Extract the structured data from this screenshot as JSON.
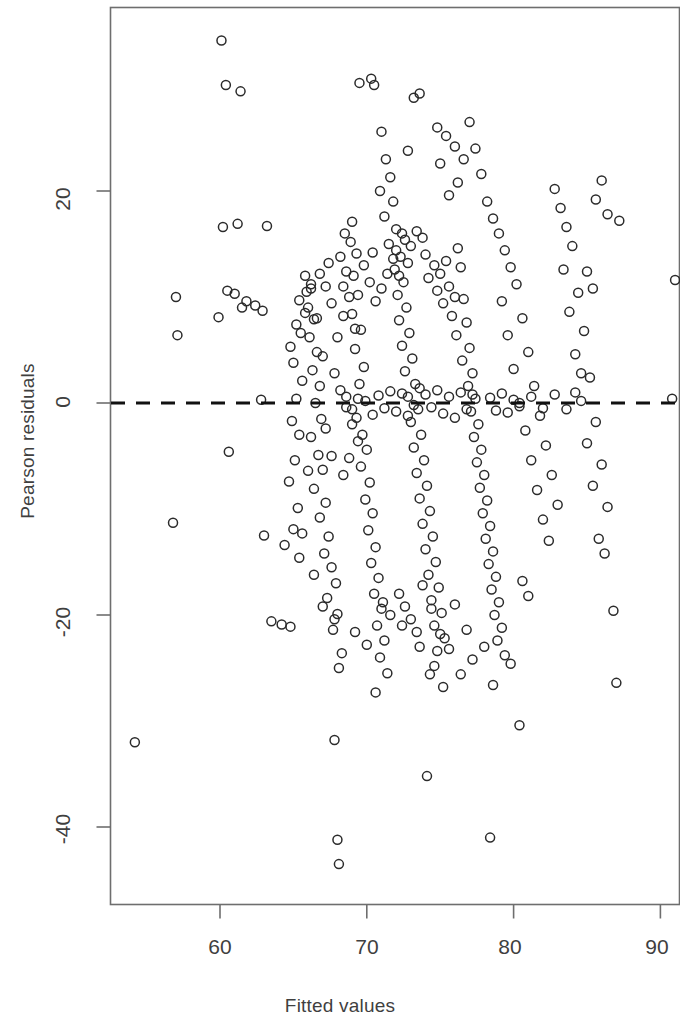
{
  "chart_data": {
    "type": "scatter",
    "title": "",
    "xlabel": "Fitted values",
    "ylabel": "Pearson residuals",
    "xlim": [
      53.0,
      91.5
    ],
    "ylim": [
      -47.0,
      39.0
    ],
    "xticks": [
      60,
      70,
      80,
      90
    ],
    "xtick_labels": [
      "60",
      "70",
      "80",
      "90"
    ],
    "yticks": [
      20,
      0,
      -20,
      -40
    ],
    "ytick_labels": [
      "20",
      "0",
      "-20",
      "-40"
    ],
    "grid": false,
    "legend": null,
    "marker": "open-circle",
    "marker_color": "#2b2b2b",
    "marker_size_px": 9,
    "frame_color": "#6e6e6e",
    "reference_line": {
      "orientation": "horizontal",
      "y": 0,
      "style": "dashed",
      "color": "#111111",
      "width_px": 3
    },
    "points": [
      [
        54.2,
        -32.0
      ],
      [
        56.8,
        -11.3
      ],
      [
        57.1,
        6.4
      ],
      [
        57.0,
        10.0
      ],
      [
        60.1,
        34.2
      ],
      [
        60.4,
        30.0
      ],
      [
        61.4,
        29.4
      ],
      [
        60.2,
        16.6
      ],
      [
        61.2,
        16.9
      ],
      [
        60.5,
        10.6
      ],
      [
        61.0,
        10.3
      ],
      [
        61.5,
        9.0
      ],
      [
        59.9,
        8.1
      ],
      [
        61.8,
        9.6
      ],
      [
        60.6,
        -4.6
      ],
      [
        62.4,
        9.2
      ],
      [
        62.9,
        8.7
      ],
      [
        63.2,
        16.7
      ],
      [
        62.8,
        0.3
      ],
      [
        63.5,
        -20.6
      ],
      [
        64.2,
        -20.9
      ],
      [
        64.8,
        -21.1
      ],
      [
        63.0,
        -12.5
      ],
      [
        64.4,
        -13.4
      ],
      [
        65.0,
        -11.9
      ],
      [
        65.6,
        -12.3
      ],
      [
        65.3,
        -9.9
      ],
      [
        64.7,
        -7.4
      ],
      [
        65.1,
        -5.4
      ],
      [
        65.4,
        -3.0
      ],
      [
        64.9,
        -1.7
      ],
      [
        65.2,
        0.4
      ],
      [
        65.6,
        2.1
      ],
      [
        65.0,
        3.8
      ],
      [
        64.8,
        5.3
      ],
      [
        65.5,
        6.6
      ],
      [
        65.2,
        7.4
      ],
      [
        65.8,
        8.5
      ],
      [
        65.4,
        9.7
      ],
      [
        65.9,
        10.5
      ],
      [
        66.2,
        11.2
      ],
      [
        66.0,
        9.0
      ],
      [
        66.4,
        7.9
      ],
      [
        66.1,
        6.2
      ],
      [
        66.6,
        4.8
      ],
      [
        66.3,
        3.1
      ],
      [
        66.8,
        1.6
      ],
      [
        66.5,
        0.0
      ],
      [
        66.9,
        -1.5
      ],
      [
        66.2,
        -3.2
      ],
      [
        66.7,
        -4.9
      ],
      [
        67.0,
        -6.3
      ],
      [
        66.4,
        -8.1
      ],
      [
        67.2,
        -9.4
      ],
      [
        66.8,
        -10.8
      ],
      [
        67.4,
        -12.6
      ],
      [
        67.1,
        -14.2
      ],
      [
        67.6,
        -15.5
      ],
      [
        67.9,
        -17.0
      ],
      [
        67.3,
        -18.4
      ],
      [
        68.0,
        -19.9
      ],
      [
        67.7,
        -21.4
      ],
      [
        68.3,
        -23.6
      ],
      [
        68.1,
        -25.0
      ],
      [
        67.8,
        -31.8
      ],
      [
        68.0,
        -41.2
      ],
      [
        68.1,
        -43.5
      ],
      [
        68.4,
        11.0
      ],
      [
        68.6,
        12.4
      ],
      [
        68.2,
        13.8
      ],
      [
        68.9,
        15.2
      ],
      [
        68.5,
        16.0
      ],
      [
        69.0,
        17.1
      ],
      [
        69.3,
        14.1
      ],
      [
        69.1,
        12.0
      ],
      [
        69.4,
        10.2
      ],
      [
        69.0,
        8.4
      ],
      [
        69.6,
        6.9
      ],
      [
        69.2,
        5.1
      ],
      [
        69.8,
        3.4
      ],
      [
        69.5,
        1.8
      ],
      [
        69.9,
        0.2
      ],
      [
        69.3,
        -1.4
      ],
      [
        69.7,
        -3.0
      ],
      [
        70.0,
        -4.4
      ],
      [
        69.6,
        -6.0
      ],
      [
        70.2,
        -7.5
      ],
      [
        69.9,
        -9.1
      ],
      [
        70.4,
        -10.4
      ],
      [
        70.1,
        -12.0
      ],
      [
        70.6,
        -13.6
      ],
      [
        70.3,
        -15.1
      ],
      [
        70.8,
        -16.5
      ],
      [
        70.5,
        -18.0
      ],
      [
        71.0,
        -19.4
      ],
      [
        70.7,
        -21.0
      ],
      [
        71.2,
        -22.4
      ],
      [
        70.9,
        -24.0
      ],
      [
        71.4,
        -25.5
      ],
      [
        70.6,
        -27.3
      ],
      [
        71.1,
        -18.8
      ],
      [
        69.5,
        30.2
      ],
      [
        70.3,
        30.6
      ],
      [
        70.5,
        30.0
      ],
      [
        71.0,
        25.6
      ],
      [
        71.3,
        23.0
      ],
      [
        71.6,
        21.3
      ],
      [
        70.9,
        20.0
      ],
      [
        71.8,
        19.0
      ],
      [
        71.2,
        17.6
      ],
      [
        72.0,
        16.4
      ],
      [
        71.5,
        15.0
      ],
      [
        72.3,
        13.8
      ],
      [
        71.9,
        12.6
      ],
      [
        72.5,
        11.4
      ],
      [
        72.1,
        10.2
      ],
      [
        72.7,
        9.0
      ],
      [
        72.2,
        7.8
      ],
      [
        72.9,
        6.6
      ],
      [
        72.4,
        5.4
      ],
      [
        73.1,
        4.2
      ],
      [
        72.6,
        3.0
      ],
      [
        73.3,
        1.8
      ],
      [
        72.8,
        0.6
      ],
      [
        73.5,
        -0.6
      ],
      [
        73.0,
        -1.8
      ],
      [
        73.7,
        -3.0
      ],
      [
        73.2,
        -4.2
      ],
      [
        73.9,
        -5.4
      ],
      [
        73.4,
        -6.6
      ],
      [
        74.1,
        -7.8
      ],
      [
        73.6,
        -9.0
      ],
      [
        74.3,
        -10.2
      ],
      [
        73.8,
        -11.4
      ],
      [
        74.5,
        -12.6
      ],
      [
        74.0,
        -13.8
      ],
      [
        74.7,
        -15.0
      ],
      [
        74.2,
        -16.2
      ],
      [
        74.9,
        -17.4
      ],
      [
        74.4,
        -18.6
      ],
      [
        75.1,
        -19.8
      ],
      [
        74.6,
        -21.0
      ],
      [
        75.3,
        -22.2
      ],
      [
        74.8,
        -23.4
      ],
      [
        74.3,
        -25.6
      ],
      [
        74.1,
        -35.2
      ],
      [
        72.4,
        16.0
      ],
      [
        72.6,
        15.4
      ],
      [
        72.0,
        14.4
      ],
      [
        72.8,
        13.2
      ],
      [
        73.0,
        14.8
      ],
      [
        73.4,
        16.2
      ],
      [
        73.8,
        15.6
      ],
      [
        74.0,
        14.0
      ],
      [
        74.6,
        13.0
      ],
      [
        74.2,
        11.8
      ],
      [
        74.8,
        10.6
      ],
      [
        75.0,
        12.2
      ],
      [
        75.4,
        13.4
      ],
      [
        75.6,
        11.0
      ],
      [
        75.2,
        9.4
      ],
      [
        75.8,
        8.2
      ],
      [
        76.0,
        10.0
      ],
      [
        76.4,
        12.8
      ],
      [
        76.2,
        14.6
      ],
      [
        76.6,
        9.8
      ],
      [
        76.8,
        7.6
      ],
      [
        76.1,
        6.4
      ],
      [
        77.0,
        5.2
      ],
      [
        76.5,
        4.0
      ],
      [
        77.2,
        2.8
      ],
      [
        76.9,
        1.6
      ],
      [
        77.4,
        0.4
      ],
      [
        77.1,
        -0.8
      ],
      [
        77.6,
        -2.0
      ],
      [
        77.3,
        -3.2
      ],
      [
        77.8,
        -4.4
      ],
      [
        77.5,
        -5.6
      ],
      [
        78.0,
        -6.8
      ],
      [
        77.7,
        -8.0
      ],
      [
        78.2,
        -9.2
      ],
      [
        77.9,
        -10.4
      ],
      [
        78.4,
        -11.6
      ],
      [
        78.1,
        -12.8
      ],
      [
        78.6,
        -14.0
      ],
      [
        78.3,
        -15.2
      ],
      [
        78.8,
        -16.4
      ],
      [
        78.5,
        -17.6
      ],
      [
        79.0,
        -18.8
      ],
      [
        78.7,
        -20.0
      ],
      [
        79.2,
        -21.2
      ],
      [
        78.9,
        -22.4
      ],
      [
        79.4,
        -23.8
      ],
      [
        78.6,
        -26.6
      ],
      [
        78.4,
        -41.0
      ],
      [
        74.8,
        26.0
      ],
      [
        75.4,
        25.2
      ],
      [
        76.0,
        24.2
      ],
      [
        75.0,
        22.6
      ],
      [
        76.6,
        23.0
      ],
      [
        77.0,
        26.5
      ],
      [
        77.4,
        24.0
      ],
      [
        77.8,
        21.6
      ],
      [
        76.2,
        20.8
      ],
      [
        75.6,
        19.6
      ],
      [
        78.2,
        19.0
      ],
      [
        78.6,
        17.4
      ],
      [
        79.0,
        16.0
      ],
      [
        79.4,
        14.4
      ],
      [
        79.8,
        12.8
      ],
      [
        80.2,
        11.2
      ],
      [
        79.2,
        9.6
      ],
      [
        80.6,
        8.0
      ],
      [
        79.6,
        6.4
      ],
      [
        81.0,
        4.8
      ],
      [
        80.0,
        3.2
      ],
      [
        81.4,
        1.6
      ],
      [
        80.4,
        0.0
      ],
      [
        81.8,
        -1.2
      ],
      [
        80.8,
        -2.6
      ],
      [
        82.2,
        -4.0
      ],
      [
        81.2,
        -5.4
      ],
      [
        82.6,
        -6.8
      ],
      [
        81.6,
        -8.2
      ],
      [
        83.0,
        -9.6
      ],
      [
        82.0,
        -11.0
      ],
      [
        82.4,
        -13.0
      ],
      [
        80.6,
        -16.8
      ],
      [
        81.0,
        -18.2
      ],
      [
        79.8,
        -24.6
      ],
      [
        80.4,
        -30.4
      ],
      [
        82.8,
        20.2
      ],
      [
        83.2,
        18.4
      ],
      [
        83.6,
        16.6
      ],
      [
        84.0,
        14.8
      ],
      [
        83.4,
        12.6
      ],
      [
        84.4,
        10.4
      ],
      [
        83.8,
        8.6
      ],
      [
        84.8,
        6.8
      ],
      [
        84.2,
        4.6
      ],
      [
        85.2,
        2.4
      ],
      [
        84.6,
        0.2
      ],
      [
        85.6,
        -1.8
      ],
      [
        85.0,
        -3.8
      ],
      [
        86.0,
        -5.8
      ],
      [
        85.4,
        -7.8
      ],
      [
        86.4,
        -9.8
      ],
      [
        85.8,
        -12.8
      ],
      [
        86.2,
        -14.2
      ],
      [
        86.8,
        -19.6
      ],
      [
        87.0,
        -26.4
      ],
      [
        85.6,
        19.2
      ],
      [
        86.4,
        17.8
      ],
      [
        86.0,
        21.0
      ],
      [
        87.2,
        17.2
      ],
      [
        84.6,
        2.8
      ],
      [
        85.0,
        12.4
      ],
      [
        85.4,
        10.8
      ],
      [
        91.0,
        11.6
      ],
      [
        90.8,
        0.4
      ],
      [
        73.2,
        28.8
      ],
      [
        73.6,
        29.2
      ],
      [
        72.8,
        23.8
      ],
      [
        71.4,
        12.2
      ],
      [
        71.8,
        13.6
      ],
      [
        72.2,
        12.0
      ],
      [
        71.0,
        10.8
      ],
      [
        70.6,
        9.6
      ],
      [
        70.2,
        11.4
      ],
      [
        69.8,
        13.0
      ],
      [
        70.4,
        14.2
      ],
      [
        68.8,
        10.0
      ],
      [
        68.4,
        8.2
      ],
      [
        69.2,
        7.0
      ],
      [
        68.0,
        6.2
      ],
      [
        67.6,
        9.4
      ],
      [
        67.2,
        11.0
      ],
      [
        66.8,
        12.2
      ],
      [
        67.4,
        13.2
      ],
      [
        66.2,
        10.8
      ],
      [
        65.8,
        12.0
      ],
      [
        66.6,
        8.0
      ],
      [
        67.0,
        4.4
      ],
      [
        67.8,
        2.8
      ],
      [
        68.2,
        1.2
      ],
      [
        68.6,
        -0.4
      ],
      [
        69.0,
        -2.0
      ],
      [
        69.4,
        -3.6
      ],
      [
        68.8,
        -5.2
      ],
      [
        68.4,
        -6.8
      ],
      [
        67.6,
        -5.0
      ],
      [
        67.2,
        -2.4
      ],
      [
        66.0,
        -6.4
      ],
      [
        65.4,
        -14.6
      ],
      [
        66.4,
        -16.2
      ],
      [
        67.0,
        -19.2
      ],
      [
        67.8,
        -20.4
      ],
      [
        69.2,
        -21.6
      ],
      [
        70.0,
        -22.8
      ],
      [
        72.2,
        -18.0
      ],
      [
        72.6,
        -19.2
      ],
      [
        73.0,
        -20.4
      ],
      [
        73.4,
        -21.6
      ],
      [
        71.6,
        -20.0
      ],
      [
        72.4,
        -21.0
      ],
      [
        73.8,
        -17.2
      ],
      [
        74.4,
        -19.4
      ],
      [
        75.0,
        -21.8
      ],
      [
        75.6,
        -23.2
      ],
      [
        76.0,
        -19.0
      ],
      [
        76.8,
        -21.4
      ],
      [
        77.2,
        -24.2
      ],
      [
        78.0,
        -23.0
      ],
      [
        74.6,
        -24.8
      ],
      [
        73.6,
        -23.0
      ],
      [
        75.2,
        -26.8
      ],
      [
        76.4,
        -25.6
      ],
      [
        74.0,
        0.8
      ],
      [
        74.4,
        -0.4
      ],
      [
        74.8,
        1.2
      ],
      [
        75.2,
        -1.0
      ],
      [
        75.6,
        0.6
      ],
      [
        76.0,
        -1.4
      ],
      [
        76.4,
        1.0
      ],
      [
        76.8,
        -0.6
      ],
      [
        77.2,
        0.8
      ],
      [
        73.2,
        -0.2
      ],
      [
        73.6,
        1.4
      ],
      [
        72.8,
        -1.2
      ],
      [
        72.4,
        0.9
      ],
      [
        72.0,
        -0.8
      ],
      [
        71.6,
        1.1
      ],
      [
        71.2,
        -0.5
      ],
      [
        70.8,
        0.7
      ],
      [
        70.4,
        -1.1
      ],
      [
        78.4,
        0.5
      ],
      [
        78.8,
        -0.7
      ],
      [
        79.2,
        0.9
      ],
      [
        79.6,
        -0.9
      ],
      [
        80.0,
        0.3
      ],
      [
        80.4,
        -0.3
      ],
      [
        81.2,
        0.6
      ],
      [
        82.0,
        -0.5
      ],
      [
        82.8,
        0.8
      ],
      [
        83.6,
        -0.6
      ],
      [
        84.2,
        1.0
      ],
      [
        69.4,
        0.4
      ],
      [
        69.0,
        -0.6
      ],
      [
        68.6,
        0.6
      ]
    ]
  },
  "axes": {
    "x_label": "Fitted values",
    "y_label": "Pearson residuals",
    "x_ticks": [
      "60",
      "70",
      "80",
      "90"
    ],
    "y_ticks": [
      "20",
      "0",
      "-20",
      "-40"
    ]
  }
}
